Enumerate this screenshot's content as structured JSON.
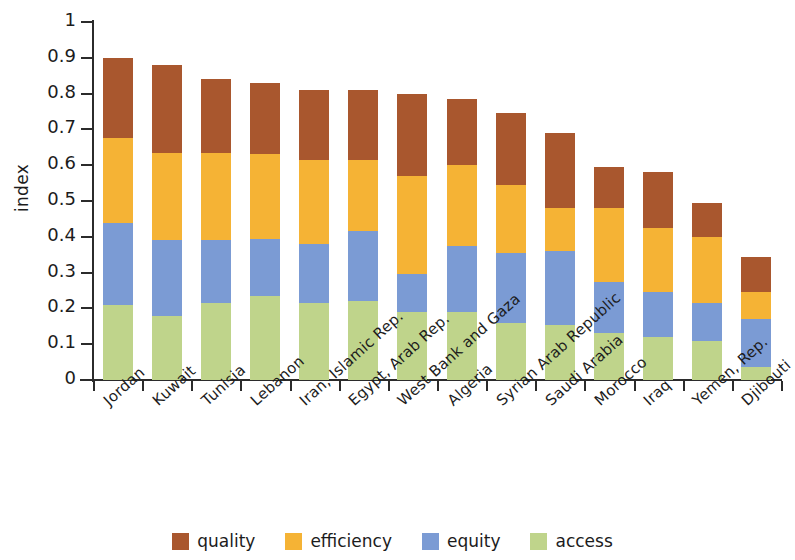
{
  "chart_data": {
    "type": "bar",
    "stacked": true,
    "title": "",
    "xlabel": "",
    "ylabel": "index",
    "ylim": [
      0,
      1
    ],
    "ytick_labels": [
      "1",
      "0.9",
      "0.8",
      "0.7",
      "0.6",
      "0.5",
      "0.4",
      "0.3",
      "0.2",
      "0.1",
      "0"
    ],
    "ytick_values": [
      1,
      0.9,
      0.8,
      0.7,
      0.6,
      0.5,
      0.4,
      0.3,
      0.2,
      0.1,
      0
    ],
    "grid": false,
    "legend_position": "bottom",
    "categories": [
      "Jordan",
      "Kuwait",
      "Tunisia",
      "Lebanon",
      "Iran, Islamic Rep.",
      "Egypt, Arab Rep.",
      "West Bank and Gaza",
      "Algeria",
      "Syrian Arab Republic",
      "Saudi Arabia",
      "Morocco",
      "Iraq",
      "Yemen, Rep.",
      "Djibouti"
    ],
    "series": [
      {
        "name": "quality",
        "color": "#A9572E",
        "values": [
          0.225,
          0.245,
          0.205,
          0.2,
          0.195,
          0.195,
          0.23,
          0.185,
          0.2,
          0.21,
          0.115,
          0.155,
          0.095,
          0.1
        ]
      },
      {
        "name": "efficiency",
        "color": "#F5B335",
        "values": [
          0.235,
          0.245,
          0.245,
          0.235,
          0.235,
          0.2,
          0.275,
          0.225,
          0.19,
          0.12,
          0.205,
          0.18,
          0.185,
          0.075
        ]
      },
      {
        "name": "equity",
        "color": "#7B9BD4",
        "values": [
          0.23,
          0.21,
          0.175,
          0.16,
          0.165,
          0.195,
          0.105,
          0.185,
          0.195,
          0.205,
          0.145,
          0.125,
          0.105,
          0.135
        ]
      },
      {
        "name": "access",
        "color": "#BFD48B",
        "values": [
          0.21,
          0.18,
          0.215,
          0.235,
          0.215,
          0.22,
          0.19,
          0.19,
          0.16,
          0.155,
          0.13,
          0.12,
          0.11,
          0.035
        ]
      }
    ],
    "totals": [
      0.9,
      0.88,
      0.84,
      0.83,
      0.81,
      0.81,
      0.8,
      0.785,
      0.745,
      0.69,
      0.595,
      0.58,
      0.495,
      0.345
    ]
  },
  "legend": {
    "items": [
      {
        "label": "quality",
        "color": "#A9572E"
      },
      {
        "label": "efficiency",
        "color": "#F5B335"
      },
      {
        "label": "equity",
        "color": "#7B9BD4"
      },
      {
        "label": "access",
        "color": "#BFD48B"
      }
    ]
  }
}
